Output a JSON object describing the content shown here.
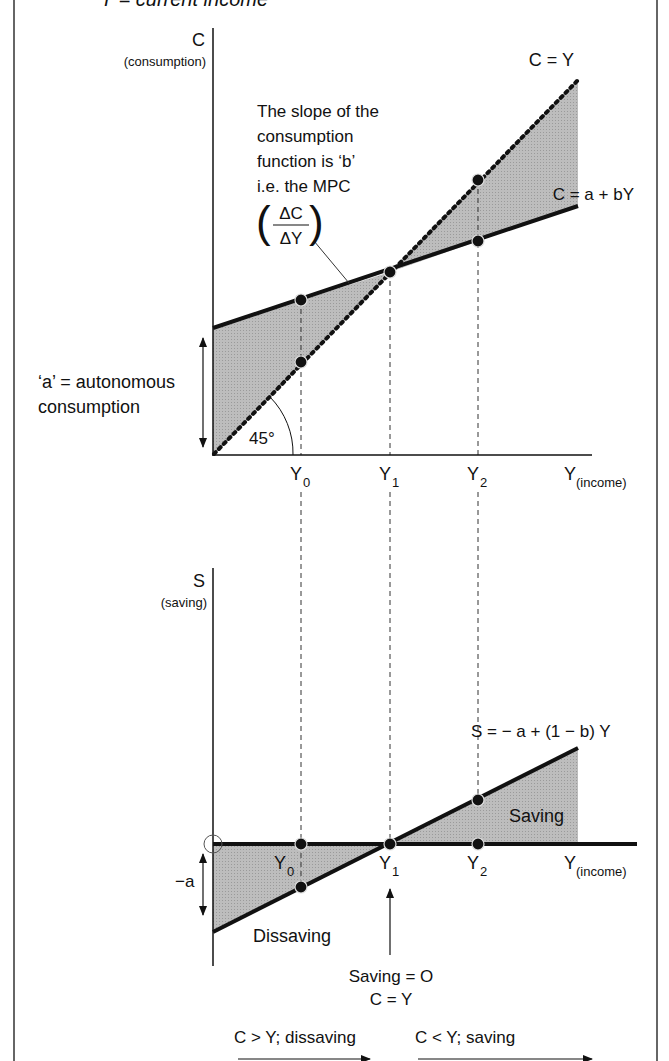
{
  "header": {
    "caption": "Y = current income"
  },
  "colors": {
    "shade": "#b4b4b4",
    "line": "#111111",
    "frame": "#333333",
    "background": "#ffffff"
  },
  "top_diagram": {
    "y_axis_label": "C",
    "y_axis_sublabel": "(consumption)",
    "line_45_label": "C = Y",
    "consumption_line_label": "C = a + bY",
    "slope_note": [
      "The slope of the",
      "consumption",
      "function is ‘b’",
      "i.e. the MPC"
    ],
    "mpc_fraction": {
      "numerator": "ΔC",
      "denominator": "ΔY"
    },
    "autonomous_label": [
      "‘a’ = autonomous",
      "consumption"
    ],
    "angle_label": "45°",
    "x_ticks": [
      {
        "base": "Y",
        "sub": "0"
      },
      {
        "base": "Y",
        "sub": "1"
      },
      {
        "base": "Y",
        "sub": "2"
      }
    ],
    "x_axis_label": {
      "base": "Y",
      "sub": "(income)"
    }
  },
  "bottom_diagram": {
    "y_axis_label": "S",
    "y_axis_sublabel": "(saving)",
    "saving_line_label": "S = − a + (1 − b) Y",
    "saving_region_label": "Saving",
    "dissaving_region_label": "Dissaving",
    "neg_a_label": "−a",
    "x_ticks": [
      {
        "base": "Y",
        "sub": "0"
      },
      {
        "base": "Y",
        "sub": "1"
      },
      {
        "base": "Y",
        "sub": "2"
      }
    ],
    "x_axis_label": {
      "base": "Y",
      "sub": "(income)"
    },
    "breakeven_note": [
      "Saving = O",
      "C = Y"
    ]
  },
  "footer": {
    "left_arrow_label": "C > Y; dissaving",
    "right_arrow_label": "C < Y; saving"
  }
}
